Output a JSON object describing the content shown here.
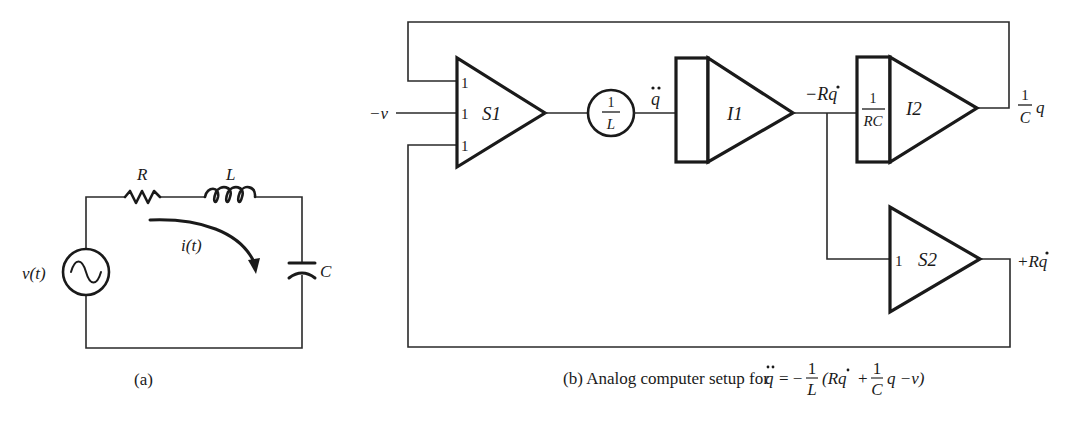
{
  "figure_a": {
    "caption": "(a)",
    "source_label": "v(t)",
    "resistor_label": "R",
    "inductor_label": "L",
    "capacitor_label": "C",
    "current_label": "i(t)"
  },
  "figure_b": {
    "caption_prefix": "(b) Analog computer setup for ",
    "equation": {
      "lhs": "q",
      "equals": "= −",
      "frac1_num": "1",
      "frac1_den": "L",
      "paren_open": "(Rq",
      "plus": "+",
      "frac2_num": "1",
      "frac2_den": "C",
      "tail": "q −v)"
    },
    "input_label": "−v",
    "summer1": {
      "name": "S1",
      "gains": [
        "1",
        "1",
        "1"
      ]
    },
    "pot": {
      "num": "1",
      "den": "L"
    },
    "qddot_label": "q",
    "integrator1": {
      "name": "I1"
    },
    "neg_rqdot_label": "−Rq",
    "integrator2": {
      "name": "I2",
      "gain_num": "1",
      "gain_den": "RC"
    },
    "output_q": {
      "num": "1",
      "den": "C",
      "var": "q"
    },
    "summer2": {
      "name": "S2",
      "gain": "1"
    },
    "pos_rqdot_label": "+Rq"
  }
}
